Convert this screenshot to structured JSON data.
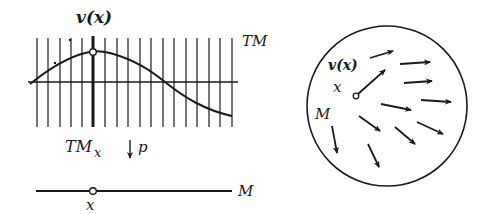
{
  "figure": {
    "left_panel": {
      "vector_label": "v(x)",
      "tangent_bundle_label": "TM",
      "fiber_label": "TM",
      "fiber_subscript": "x",
      "projection_label": "p",
      "manifold_label": "M",
      "point_label": "x",
      "fiber_count": 18
    },
    "right_panel": {
      "vector_label": "v(x)",
      "point_label": "x",
      "manifold_label": "M"
    },
    "colors": {
      "ink": "#1a1a1a",
      "background": "#ffffff"
    }
  }
}
